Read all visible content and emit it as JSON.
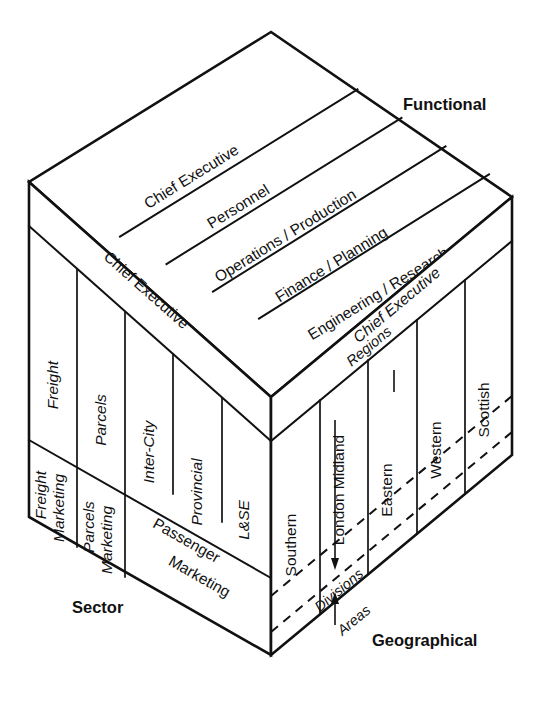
{
  "diagram": {
    "axis_labels": {
      "functional": "Functional",
      "sector": "Sector",
      "geographical": "Geographical"
    },
    "colors": {
      "stroke": "#111111",
      "fill": "#ffffff"
    }
  },
  "top_face": {
    "axis_name": "Functional",
    "head_label": "Chief Executive",
    "bands": [
      {
        "label": "Chief Executive"
      },
      {
        "label": "Personnel"
      },
      {
        "label": "Operations / Production"
      },
      {
        "label": "Finance / Planning"
      },
      {
        "label": "Engineering / Research"
      }
    ]
  },
  "left_face": {
    "axis_name": "Sector",
    "head_label": "Chief Executive",
    "columns": [
      {
        "top": "Freight",
        "bottom_line1": "Freight",
        "bottom_line2": "Marketing"
      },
      {
        "top": "Parcels",
        "bottom_line1": "Parcels",
        "bottom_line2": "Marketing"
      },
      {
        "top": "Inter-City",
        "bottom_line1": "",
        "bottom_line2": ""
      },
      {
        "top": "Provincial",
        "bottom_line1": "",
        "bottom_line2": ""
      },
      {
        "top": "L&SE",
        "bottom_line1": "",
        "bottom_line2": ""
      }
    ],
    "merged_bottom": {
      "line1": "Passenger",
      "line2": "Marketing"
    }
  },
  "right_face": {
    "axis_name": "Geographical",
    "head_label": "Chief Executive",
    "columns": [
      {
        "label": "Southern"
      },
      {
        "label": "London Midland"
      },
      {
        "label": "Eastern"
      },
      {
        "label": "Western"
      },
      {
        "label": "Scottish"
      }
    ],
    "level_markers": [
      {
        "label": "Regions",
        "direction": "down"
      },
      {
        "label": "Divisions",
        "direction": "none"
      },
      {
        "label": "Areas",
        "direction": "up"
      }
    ]
  }
}
